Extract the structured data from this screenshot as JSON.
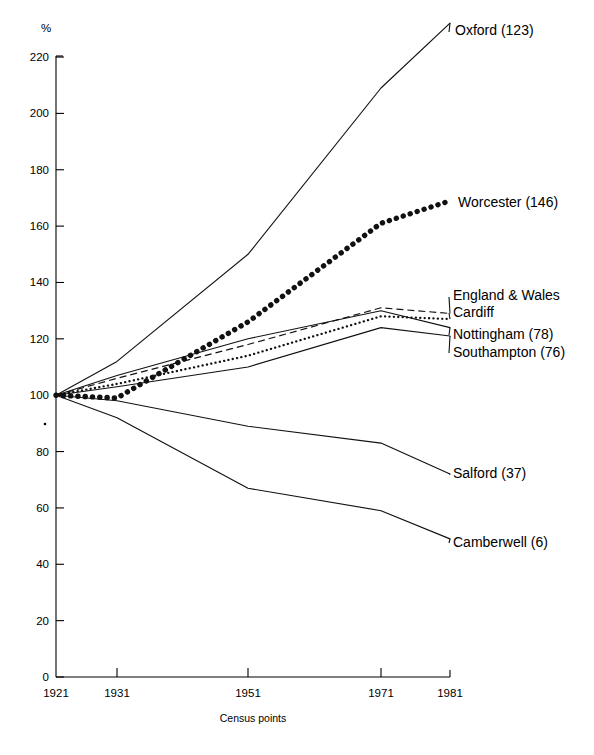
{
  "chart_data": {
    "type": "line",
    "title": "",
    "xlabel": "Census points",
    "ylabel": "%",
    "categories": [
      "1921",
      "1931",
      "1951",
      "1971",
      "1981"
    ],
    "x": [
      1921,
      1931,
      1951,
      1971,
      1981
    ],
    "ylim": [
      0,
      230
    ],
    "yticks": [
      0,
      20,
      40,
      60,
      80,
      100,
      120,
      140,
      160,
      180,
      200,
      220
    ],
    "grid": false,
    "legend_position": "right-inline-labels",
    "series": [
      {
        "name": "Oxford (146)",
        "label": "Oxford (123)",
        "style": "solid",
        "values": [
          100,
          112,
          150,
          209,
          232
        ]
      },
      {
        "name": "Worcester",
        "label": "Worcester (146)",
        "style": "dotted-large",
        "values": [
          100,
          99,
          126,
          161,
          169
        ]
      },
      {
        "name": "England & Wales",
        "label": "England & Wales",
        "style": "dashed",
        "values": [
          100,
          106,
          118,
          131,
          129
        ]
      },
      {
        "name": "Cardiff",
        "label": "Cardiff",
        "style": "dotted-small",
        "values": [
          100,
          104,
          114,
          128,
          127
        ]
      },
      {
        "name": "Nottingham",
        "label": "Nottingham (78)",
        "style": "solid",
        "values": [
          100,
          107,
          120,
          130,
          124
        ]
      },
      {
        "name": "Southampton",
        "label": "Southampton (76)",
        "style": "solid",
        "values": [
          100,
          103,
          110,
          124,
          121
        ]
      },
      {
        "name": "Salford",
        "label": "Salford (37)",
        "style": "solid",
        "values": [
          100,
          98,
          89,
          83,
          72
        ]
      },
      {
        "name": "Camberwell",
        "label": "Camberwell (6)",
        "style": "solid",
        "values": [
          100,
          92,
          67,
          59,
          49
        ]
      }
    ],
    "annotations": [
      {
        "text": "Oxford (123)",
        "x": 455,
        "y": 35
      },
      {
        "text": "Worcester (146)",
        "x": 458,
        "y": 207
      },
      {
        "text": "England & Wales",
        "x": 453,
        "y": 300
      },
      {
        "text": "Cardiff",
        "x": 453,
        "y": 317
      },
      {
        "text": "Nottingham (78)",
        "x": 453,
        "y": 339
      },
      {
        "text": "Southampton (76)",
        "x": 453,
        "y": 357
      },
      {
        "text": "Salford (37)",
        "x": 453,
        "y": 478
      },
      {
        "text": "Camberwell (6)",
        "x": 453,
        "y": 547
      }
    ],
    "axis": {
      "unit_label": "%",
      "x_axis_title": "Census points"
    }
  }
}
